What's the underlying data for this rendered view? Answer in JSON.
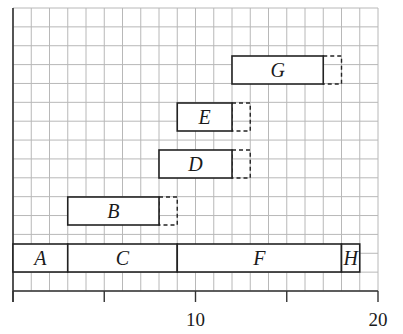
{
  "chart_data": {
    "type": "gantt",
    "title": "",
    "xlabel": "",
    "ylabel": "",
    "xlim": [
      0,
      20
    ],
    "x_ticks": [
      0,
      5,
      10,
      15,
      20
    ],
    "x_tick_labels": [
      "",
      "",
      "10",
      "",
      "20"
    ],
    "grid": true,
    "legend": null,
    "activities": [
      {
        "name": "A",
        "start": 0,
        "end": 3,
        "float_end": 3,
        "row": 0
      },
      {
        "name": "C",
        "start": 3,
        "end": 9,
        "float_end": 9,
        "row": 0
      },
      {
        "name": "F",
        "start": 9,
        "end": 18,
        "float_end": 18,
        "row": 0
      },
      {
        "name": "H",
        "start": 18,
        "end": 19,
        "float_end": 19,
        "row": 0
      },
      {
        "name": "B",
        "start": 3,
        "end": 8,
        "float_end": 9,
        "row": 1
      },
      {
        "name": "D",
        "start": 8,
        "end": 12,
        "float_end": 13,
        "row": 2
      },
      {
        "name": "E",
        "start": 9,
        "end": 12,
        "float_end": 13,
        "row": 3
      },
      {
        "name": "G",
        "start": 12,
        "end": 17,
        "float_end": 18,
        "row": 4
      }
    ]
  },
  "colors": {
    "grid": "#b8b8b8",
    "bar_border": "#222222",
    "bar_fill": "#ffffff",
    "text": "#1a1a1a"
  }
}
